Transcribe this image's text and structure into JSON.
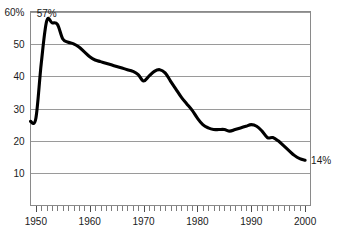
{
  "chart_data": {
    "type": "line",
    "title": "",
    "subtitle": "",
    "xlabel": "",
    "ylabel": "",
    "xlim": [
      1949,
      2001
    ],
    "ylim": [
      0,
      60
    ],
    "grid": true,
    "legend": "none",
    "y_ticks": [
      {
        "value": 60,
        "label": "60%"
      },
      {
        "value": 50,
        "label": "50"
      },
      {
        "value": 40,
        "label": "40"
      },
      {
        "value": 30,
        "label": "30"
      },
      {
        "value": 20,
        "label": "20"
      },
      {
        "value": 10,
        "label": "10"
      }
    ],
    "x_ticks": [
      {
        "value": 1950,
        "label": "1950"
      },
      {
        "value": 1960,
        "label": "1960"
      },
      {
        "value": 1970,
        "label": "1970"
      },
      {
        "value": 1980,
        "label": "1980"
      },
      {
        "value": 1990,
        "label": "1990"
      },
      {
        "value": 2000,
        "label": "2000"
      }
    ],
    "minor_tick_interval": 1,
    "annotations": [
      {
        "name": "peak-value-label",
        "text": "57%",
        "x": 1952,
        "y": 57,
        "position": "above-left"
      },
      {
        "name": "end-value-label",
        "text": "14%",
        "x": 2000,
        "y": 14,
        "position": "right"
      }
    ],
    "series": [
      {
        "name": "value",
        "color": "#000000",
        "x": [
          1949,
          1950,
          1951,
          1952,
          1953,
          1954,
          1955,
          1956,
          1957,
          1958,
          1959,
          1960,
          1961,
          1962,
          1963,
          1964,
          1965,
          1966,
          1967,
          1968,
          1969,
          1970,
          1971,
          1972,
          1973,
          1974,
          1975,
          1976,
          1977,
          1978,
          1979,
          1980,
          1981,
          1982,
          1983,
          1984,
          1985,
          1986,
          1987,
          1988,
          1989,
          1990,
          1991,
          1992,
          1993,
          1994,
          1995,
          1996,
          1997,
          1998,
          1999,
          2000
        ],
        "values": [
          26,
          27,
          44,
          57,
          56.5,
          56,
          51.5,
          50.5,
          50,
          49,
          47.5,
          46,
          45,
          44.5,
          44,
          43.5,
          43,
          42.5,
          42,
          41.5,
          40.5,
          38.5,
          40,
          41.5,
          42,
          41,
          38.5,
          36,
          33.5,
          31.5,
          29.5,
          27,
          25,
          24,
          23.5,
          23.5,
          23.5,
          23,
          23.5,
          24,
          24.5,
          25,
          24.5,
          23,
          21,
          21,
          20,
          18.5,
          17,
          15.5,
          14.5,
          14
        ]
      }
    ]
  }
}
